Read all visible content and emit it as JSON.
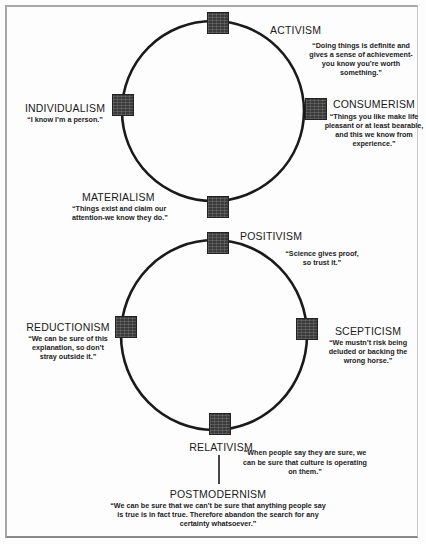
{
  "diagram": {
    "top_cycle": {
      "nodes": [
        {
          "id": "activism",
          "term": "ACTIVISM",
          "quote": "“Doing things is definite and gives a sense of achievement-you know you’re worth something.”"
        },
        {
          "id": "consumerism",
          "term": "CONSUMERISM",
          "quote": "“Things you like make life pleasant or at least bearable, and this we know from experience.”"
        },
        {
          "id": "materialism",
          "term": "MATERIALISM",
          "quote": "“Things exist and claim our attention-we know they do.”"
        },
        {
          "id": "individualism",
          "term": "INDIVIDUALISM",
          "quote": "“I know I’m a person.”"
        }
      ]
    },
    "bottom_cycle": {
      "nodes": [
        {
          "id": "positivism",
          "term": "POSITIVISM",
          "quote": "“Science gives proof, so trust it.”"
        },
        {
          "id": "scepticism",
          "term": "SCEPTICISM",
          "quote": "“We mustn’t risk being deluded or backing the wrong horse.”"
        },
        {
          "id": "relativism",
          "term": "RELATIVISM",
          "quote": "“When people say they are sure, we can be sure that culture is operating on them.”"
        },
        {
          "id": "reductionism",
          "term": "REDUCTIONISM",
          "quote": "“We can be sure of this explanation, so don’t stray outside it.”"
        }
      ]
    },
    "outcome": {
      "term": "POSTMODERNISM",
      "quote": "“We can be sure that we can’t be sure that anything people say is true is in fact true. Therefore abandon the search for any certainty whatsoever.”"
    },
    "colors": {
      "line": "#1a1a1a",
      "node": "#3a3a3a",
      "frame": "#a8a8a8"
    }
  }
}
